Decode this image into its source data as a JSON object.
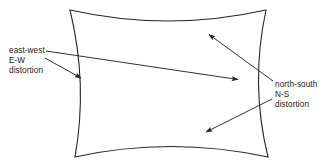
{
  "figure": {
    "name": "pincushion-distortion-diagram",
    "background_color": "#ffffff",
    "stroke_color": "#262626",
    "text_color": "#1a1a1a",
    "width": 330,
    "height": 165
  },
  "shape": {
    "name": "pincushion-distorted-rectangle",
    "description": "rectangle with concave sides",
    "corners": {
      "top_left": [
        70,
        10
      ],
      "top_right": [
        266,
        10
      ],
      "bottom_right": [
        268,
        157
      ],
      "bottom_left": [
        75,
        157
      ]
    },
    "edge_bow": {
      "top_mid_y": 25,
      "bottom_mid_y": 144,
      "left_mid_x": 86,
      "right_mid_x": 252
    }
  },
  "labels": {
    "east_west": {
      "line1": "east-west",
      "line2": "E-W",
      "line3": "distortion"
    },
    "north_south": {
      "line1": "north-south",
      "line2": "N-S",
      "line3": "distortion"
    }
  },
  "arrows": [
    {
      "name": "east-west-long-arrow",
      "from": [
        46,
        51
      ],
      "to": [
        240,
        80
      ],
      "points_to": "right-side-concave-edge"
    },
    {
      "name": "east-west-short-arrow",
      "from": [
        45,
        58
      ],
      "to": [
        83,
        79
      ],
      "points_to": "left-side-concave-edge"
    },
    {
      "name": "north-south-upper-arrow",
      "from": [
        273,
        81
      ],
      "to": [
        207,
        33
      ],
      "points_to": "top-concave-edge"
    },
    {
      "name": "north-south-lower-arrow",
      "from": [
        272,
        99
      ],
      "to": [
        204,
        133
      ],
      "points_to": "bottom-concave-edge"
    }
  ]
}
